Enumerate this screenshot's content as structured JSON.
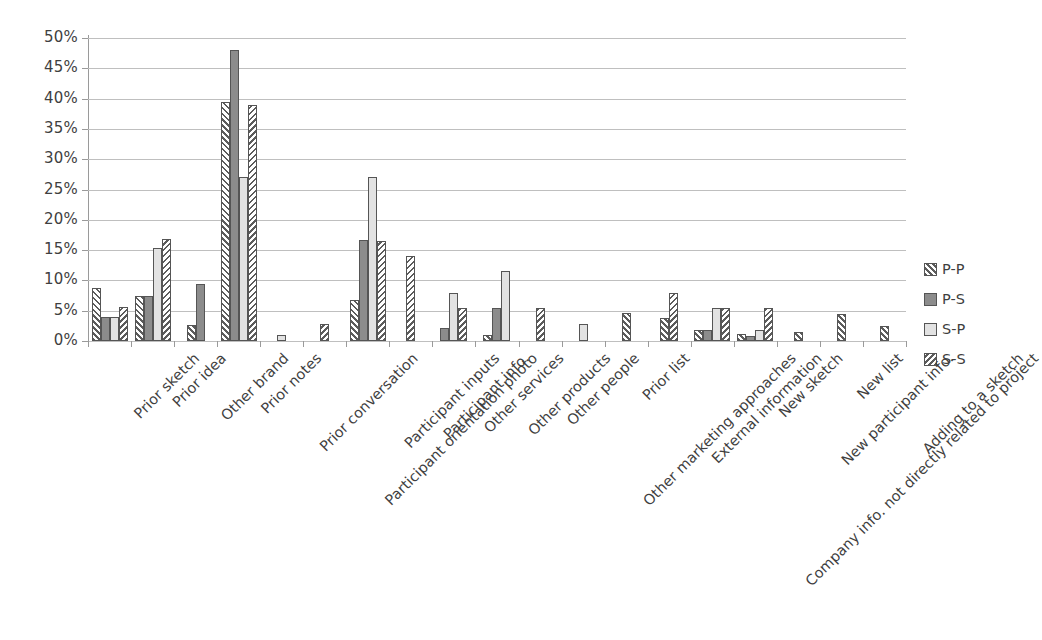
{
  "chart_data": {
    "type": "bar",
    "title": "",
    "xlabel": "",
    "ylabel": "",
    "ylim": [
      0,
      50
    ],
    "ytick_labels": [
      "50%",
      "45%",
      "40%",
      "35%",
      "30%",
      "25%",
      "20%",
      "15%",
      "10%",
      "5%",
      "0%"
    ],
    "ytick_values": [
      50,
      45,
      40,
      35,
      30,
      25,
      20,
      15,
      10,
      5,
      0
    ],
    "grid": true,
    "legend_position": "right",
    "value_suffix": "%",
    "categories": [
      "Prior sketch",
      "Prior idea",
      "Other brand",
      "Prior notes",
      "Prior conversation",
      "Participant orientation photo",
      "Participant inputs",
      "Participant info.",
      "Other services",
      "Other products",
      "Other people",
      "Other marketing approaches",
      "Prior list",
      "External information",
      "Company info. not directly related to project",
      "New sketch",
      "New participant info.",
      "New list",
      "Adding to a sketch"
    ],
    "series": [
      {
        "name": "P-P",
        "pattern": "diagonal-hatch-up",
        "color": "#ffffff",
        "values": [
          8.7,
          7.4,
          2.7,
          39.5,
          0,
          0,
          6.7,
          0,
          0,
          1.0,
          0,
          0,
          4.6,
          3.8,
          1.8,
          1.2,
          1.5,
          4.5,
          2.4
        ]
      },
      {
        "name": "P-S",
        "pattern": "solid",
        "color": "#8c8c8c",
        "values": [
          3.9,
          7.4,
          9.4,
          48.0,
          0,
          0,
          16.7,
          0,
          2.2,
          5.5,
          0,
          0,
          0,
          0,
          1.8,
          0.9,
          0,
          0,
          0
        ]
      },
      {
        "name": "S-P",
        "pattern": "light",
        "color": "#e2e2e2",
        "values": [
          4.0,
          15.4,
          0,
          27.0,
          1.0,
          0,
          27.0,
          0,
          8.0,
          11.6,
          0,
          2.8,
          0,
          0,
          5.5,
          1.8,
          0,
          0,
          0
        ]
      },
      {
        "name": "S-S",
        "pattern": "diagonal-hatch-down",
        "color": "#ffffff",
        "values": [
          5.6,
          16.8,
          0,
          39.0,
          0,
          2.8,
          16.5,
          14.0,
          5.5,
          0,
          5.5,
          0,
          0,
          7.9,
          5.5,
          5.5,
          0,
          0,
          0
        ]
      }
    ],
    "legend": [
      {
        "label": "P-P",
        "swatch": "diagonal-hatch-up"
      },
      {
        "label": "P-S",
        "swatch": "solid"
      },
      {
        "label": "S-P",
        "swatch": "light"
      },
      {
        "label": "S-S",
        "swatch": "diagonal-hatch-down"
      }
    ]
  }
}
